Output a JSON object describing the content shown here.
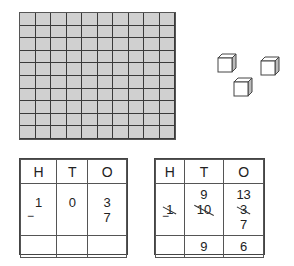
{
  "hundred_block": {
    "rows": 10,
    "cols": 10,
    "fill": "#d0d0d0"
  },
  "unit_cubes": {
    "count": 3
  },
  "left_table": {
    "headers": [
      "H",
      "T",
      "O"
    ],
    "top": [
      "1",
      "0",
      "3"
    ],
    "bottom_op": "−",
    "bottom": [
      "",
      "",
      "7"
    ],
    "answer": [
      "",
      "",
      ""
    ]
  },
  "right_table": {
    "headers": [
      "H",
      "T",
      "O"
    ],
    "regroup": [
      "",
      "9",
      "13"
    ],
    "top_crossed": [
      "1",
      "10",
      "3"
    ],
    "bottom_op": "−",
    "bottom": [
      "",
      "",
      "7"
    ],
    "answer": [
      "",
      "9",
      "6"
    ]
  }
}
